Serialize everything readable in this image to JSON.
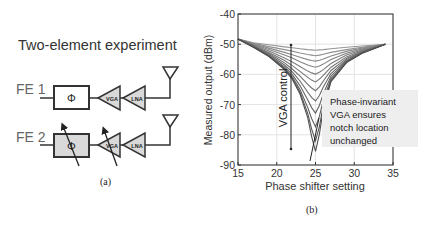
{
  "panel_a": {
    "title": "Two-element experiment",
    "caption": "(a)",
    "front_ends": [
      {
        "label": "FE 1",
        "phase_shifter": "Φ",
        "vga": "VGA",
        "lna": "LNA",
        "tunable": false
      },
      {
        "label": "FE 2",
        "phase_shifter": "Φ",
        "vga": "VGA",
        "lna": "LNA",
        "tunable": true
      }
    ],
    "icons": [
      "antenna-icon",
      "amplifier-triangle-icon",
      "tuning-arrow-icon"
    ],
    "colors": {
      "block_fill_fe1": "#ffffff",
      "block_fill_fe2": "#d9d9d9",
      "stroke": "#333333"
    }
  },
  "panel_b": {
    "caption": "(b)",
    "annotation_vga": "VGA control",
    "annotation_note": [
      "Phase-invariant",
      "VGA ensures",
      "notch location",
      "unchanged"
    ]
  },
  "chart_data": {
    "type": "line",
    "title": "",
    "xlabel": "Phase shifter setting",
    "ylabel": "Measured output (dBm)",
    "xlim": [
      15,
      35
    ],
    "ylim": [
      -90,
      -40
    ],
    "xticks": [
      15,
      20,
      25,
      30,
      35
    ],
    "yticks": [
      -90,
      -80,
      -70,
      -60,
      -50,
      -40
    ],
    "grid": true,
    "legend": "none",
    "x": [
      15,
      17,
      19,
      21,
      22,
      23,
      24,
      24.5,
      25,
      25.5,
      26,
      27,
      29,
      31,
      34
    ],
    "series": [
      {
        "name": "VGA 1",
        "values": [
          -48.3,
          -49.5,
          -50.2,
          -50.9,
          -51.2,
          -51.5,
          -51.8,
          -51.9,
          -52.0,
          -51.9,
          -51.8,
          -51.5,
          -51.0,
          -50.6,
          -50.0
        ]
      },
      {
        "name": "VGA 2",
        "values": [
          -48.3,
          -49.7,
          -50.8,
          -51.8,
          -52.3,
          -52.9,
          -53.4,
          -53.6,
          -53.8,
          -53.6,
          -53.3,
          -52.7,
          -51.8,
          -51.0,
          -50.0
        ]
      },
      {
        "name": "VGA 3",
        "values": [
          -48.3,
          -49.9,
          -51.3,
          -52.7,
          -53.5,
          -54.3,
          -55.1,
          -55.4,
          -55.6,
          -55.3,
          -54.9,
          -53.9,
          -52.4,
          -51.3,
          -50.0
        ]
      },
      {
        "name": "VGA 4",
        "values": [
          -48.3,
          -50.1,
          -51.8,
          -53.6,
          -54.6,
          -55.8,
          -56.9,
          -57.3,
          -57.6,
          -57.2,
          -56.6,
          -55.1,
          -53.0,
          -51.6,
          -50.0
        ]
      },
      {
        "name": "VGA 5",
        "values": [
          -48.3,
          -50.3,
          -52.3,
          -54.6,
          -55.9,
          -57.4,
          -58.9,
          -59.5,
          -59.9,
          -59.3,
          -58.4,
          -56.4,
          -53.6,
          -51.9,
          -50.0
        ]
      },
      {
        "name": "VGA 6",
        "values": [
          -48.3,
          -50.5,
          -52.7,
          -55.4,
          -57.1,
          -59.0,
          -61.0,
          -61.9,
          -62.5,
          -61.6,
          -60.3,
          -57.6,
          -54.2,
          -52.2,
          -50.0
        ]
      },
      {
        "name": "VGA 7",
        "values": [
          -48.3,
          -50.6,
          -53.1,
          -56.2,
          -58.2,
          -60.6,
          -63.3,
          -64.5,
          -65.4,
          -64.1,
          -62.2,
          -58.7,
          -54.7,
          -52.4,
          -50.0
        ]
      },
      {
        "name": "VGA 8",
        "values": [
          -48.3,
          -50.7,
          -53.4,
          -56.9,
          -59.2,
          -62.2,
          -65.9,
          -67.6,
          -68.8,
          -67.0,
          -64.2,
          -59.7,
          -55.1,
          -52.6,
          -50.0
        ]
      },
      {
        "name": "VGA 9",
        "values": [
          -48.3,
          -50.8,
          -53.7,
          -57.5,
          -60.1,
          -63.7,
          -68.5,
          -71.0,
          -72.8,
          -70.3,
          -66.4,
          -60.6,
          -55.5,
          -52.8,
          -50.0
        ]
      },
      {
        "name": "VGA 10",
        "values": [
          -48.3,
          -50.9,
          -53.9,
          -57.9,
          -60.8,
          -65.0,
          -71.0,
          -74.6,
          -77.4,
          -73.9,
          -68.5,
          -61.4,
          -55.8,
          -52.9,
          -50.0
        ]
      },
      {
        "name": "VGA 11",
        "values": [
          -48.3,
          -51.0,
          -54.0,
          -58.2,
          -61.3,
          -65.9,
          -73.0,
          -78.0,
          -82.0,
          -77.3,
          -70.3,
          -62.0,
          -56.0,
          -53.0,
          -50.0
        ]
      },
      {
        "name": "VGA 12",
        "values": [
          -48.3,
          -51.0,
          -54.1,
          -58.4,
          -61.6,
          -66.5,
          -74.4,
          -80.5,
          -85.5,
          -79.8,
          -71.5,
          -62.4,
          -56.1,
          -53.0,
          -50.0
        ]
      }
    ]
  }
}
